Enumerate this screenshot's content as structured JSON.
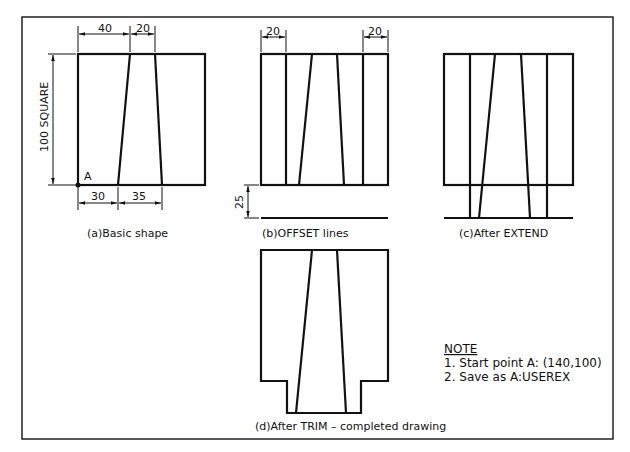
{
  "drawing": {
    "frame": {
      "x": 22,
      "y": 17,
      "width": 591,
      "height": 422
    },
    "panels": [
      {
        "id": "a",
        "caption": "(a)Basic shape",
        "dimensions": {
          "top_left": "40",
          "top_right": "20",
          "bottom_left": "30",
          "bottom_right": "35",
          "side": "100 SQUARE"
        },
        "point_label": "A"
      },
      {
        "id": "b",
        "caption": "(b)OFFSET lines",
        "dimensions": {
          "top_left": "20",
          "top_right": "20",
          "offset": "25"
        }
      },
      {
        "id": "c",
        "caption": "(c)After EXTEND"
      },
      {
        "id": "d",
        "caption": "(d)After TRIM – completed drawing"
      }
    ],
    "note": {
      "title": "NOTE",
      "lines": [
        "1. Start point A: (140,100)",
        "2. Save as A:USEREX"
      ]
    }
  }
}
